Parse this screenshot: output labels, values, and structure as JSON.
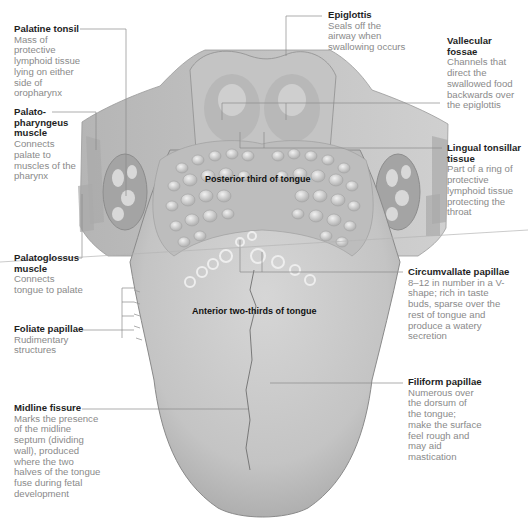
{
  "diagram": {
    "regions": {
      "posterior": "Posterior third of tongue",
      "anterior": "Anterior two-thirds of tongue"
    },
    "labels": [
      {
        "id": "palatine-tonsil",
        "title": "Palatine tonsil",
        "desc": "Mass of protective lymphoid tissue lying on either side of oropharynx"
      },
      {
        "id": "palatopharyngeus",
        "title": "Palato-pharyngeus muscle",
        "title_lines": [
          "Palato-",
          "pharyngeus",
          "muscle"
        ],
        "desc": "Connects palate to muscles of the pharynx"
      },
      {
        "id": "palatoglossus",
        "title": "Palatoglossus muscle",
        "title_lines": [
          "Palatoglossus",
          "muscle"
        ],
        "desc": "Connects tongue to palate"
      },
      {
        "id": "foliate",
        "title": "Foliate papillae",
        "desc": "Rudimentary structures"
      },
      {
        "id": "midline",
        "title": "Midline fissure",
        "desc": "Marks the presence of the midline septum (dividing wall), produced where the two halves of the tongue fuse during fetal development"
      },
      {
        "id": "epiglottis",
        "title": "Epiglottis",
        "desc": "Seals off the airway when swallowing occurs"
      },
      {
        "id": "vallecular",
        "title": "Vallecular fossae",
        "title_lines": [
          "Vallecular",
          "fossae"
        ],
        "desc": "Channels that direct the swallowed food backwards over the epiglottis"
      },
      {
        "id": "lingual-tonsillar",
        "title": "Lingual tonsillar tissue",
        "title_lines": [
          "Lingual tonsillar",
          "tissue"
        ],
        "desc": "Part of a ring of protective lymphoid tissue protecting the throat"
      },
      {
        "id": "circumvallate",
        "title": "Circumvallate papillae",
        "desc": "8–12 in number in a V-shape; rich in taste buds, sparse over the rest of tongue and produce a watery secretion"
      },
      {
        "id": "filiform",
        "title": "Filiform papillae",
        "desc": "Numerous over the dorsum of the tongue; make the surface feel rough and may aid mastication"
      }
    ],
    "colors": {
      "background": "#ffffff",
      "tongue": "#c9c9c9",
      "tongue_shadow": "#a9a9a9",
      "leader_line": "#8a8a8a",
      "title_text": "#1e1e1e",
      "desc_text": "#8a8a8a"
    }
  }
}
